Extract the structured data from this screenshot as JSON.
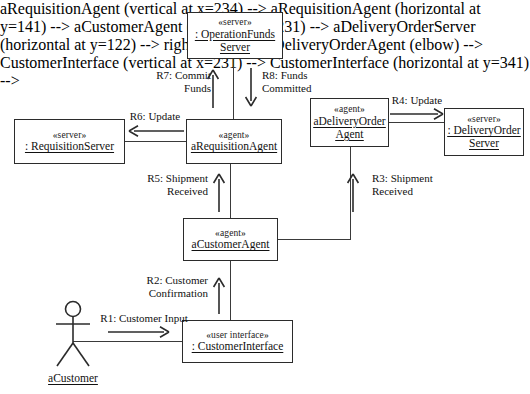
{
  "diagram": {
    "type": "uml-communication-diagram",
    "width": 530,
    "height": 394,
    "background": "#ffffff",
    "line_color": "#3a3a3a",
    "text_color": "#111111"
  },
  "nodes": [
    {
      "id": "operation-funds-server",
      "stereotype": "«server»",
      "name_line1": ": OperationFunds",
      "name_line2": "Server",
      "x": 187,
      "y": 12,
      "w": 96,
      "h": 47
    },
    {
      "id": "requisition-server",
      "stereotype": "«server»",
      "name_line1": ": RequisitionServer",
      "name_line2": "",
      "x": 14,
      "y": 119,
      "w": 111,
      "h": 45
    },
    {
      "id": "requisition-agent",
      "stereotype": "«agent»",
      "name_line1": "aRequisitionAgent",
      "name_line2": "",
      "x": 186,
      "y": 119,
      "w": 96,
      "h": 45
    },
    {
      "id": "delivery-order-agent",
      "stereotype": "«agent»",
      "name_line1": "aDeliveryOrder",
      "name_line2": "Agent",
      "x": 310,
      "y": 98,
      "w": 79,
      "h": 49
    },
    {
      "id": "delivery-order-server",
      "stereotype": "«server»",
      "name_line1": ": DeliveryOrder",
      "name_line2": "Server",
      "x": 444,
      "y": 108,
      "w": 80,
      "h": 48
    },
    {
      "id": "customer-agent",
      "stereotype": "«agent»",
      "name_line1": "aCustomerAgent",
      "name_line2": "",
      "x": 183,
      "y": 218,
      "w": 95,
      "h": 43
    },
    {
      "id": "customer-interface",
      "stereotype": "«user interface»",
      "name_line1": ": CustomerInterface",
      "name_line2": "",
      "x": 182,
      "y": 320,
      "w": 111,
      "h": 43
    }
  ],
  "actor": {
    "id": "customer-actor",
    "label": "aCustomer",
    "x": 47,
    "y": 300
  },
  "messages": [
    {
      "id": "r1",
      "line1": "R1: Customer Input",
      "line2": "",
      "direction": "right",
      "from": "customer-actor",
      "to": "customer-interface"
    },
    {
      "id": "r2",
      "line1": "R2: Customer",
      "line2": "Confirmation",
      "direction": "up",
      "from": "customer-interface",
      "to": "customer-agent"
    },
    {
      "id": "r3",
      "line1": "R3: Shipment",
      "line2": "Received",
      "direction": "up",
      "from": "customer-agent",
      "to": "delivery-order-agent"
    },
    {
      "id": "r4",
      "line1": "R4: Update",
      "line2": "",
      "direction": "right",
      "from": "delivery-order-agent",
      "to": "delivery-order-server"
    },
    {
      "id": "r5",
      "line1": "R5: Shipment",
      "line2": "Received",
      "direction": "up",
      "from": "customer-agent",
      "to": "requisition-agent"
    },
    {
      "id": "r6",
      "line1": "R6: Update",
      "line2": "",
      "direction": "left",
      "from": "requisition-agent",
      "to": "requisition-server"
    },
    {
      "id": "r7",
      "line1": "R7: Commit",
      "line2": "Funds",
      "direction": "up",
      "from": "requisition-agent",
      "to": "operation-funds-server"
    },
    {
      "id": "r8",
      "line1": "R8: Funds",
      "line2": "Committed",
      "direction": "down",
      "from": "operation-funds-server",
      "to": "requisition-agent"
    }
  ]
}
